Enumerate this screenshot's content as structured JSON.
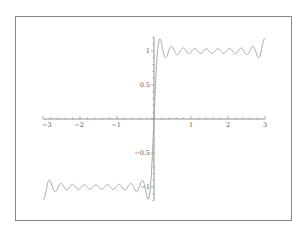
{
  "chart_data": {
    "type": "line",
    "title": "",
    "xlabel": "",
    "ylabel": "",
    "xlim": [
      -3,
      3
    ],
    "ylim": [
      -1.2,
      1.2
    ],
    "grid": false,
    "legend": null,
    "function": "(4/pi) * sum_{k=1}^{10} sin((2k-1)x)/(2k-1)",
    "x_ticks": [
      {
        "value": -3,
        "label": "−3"
      },
      {
        "value": -2,
        "label": "−2"
      },
      {
        "value": -1,
        "label": "−1"
      },
      {
        "value": 1,
        "label": "1"
      },
      {
        "value": 2,
        "label": "2"
      },
      {
        "value": 3,
        "label": "3"
      }
    ],
    "y_ticks": [
      {
        "value": 1,
        "label": "1"
      },
      {
        "value": 0.5,
        "label": "0.5"
      },
      {
        "value": -0.5,
        "label": "−0.5"
      },
      {
        "value": -1,
        "label": "−1"
      }
    ],
    "series": [
      {
        "name": "square wave partial sum",
        "color": "#a8a8a8",
        "harmonics": 10,
        "x_range": [
          -3,
          3
        ],
        "samples": 600
      }
    ]
  },
  "style": {
    "axis_color": "#777777",
    "curve_color": "#a8a8a8",
    "frame_color": "#8a8a8a"
  }
}
